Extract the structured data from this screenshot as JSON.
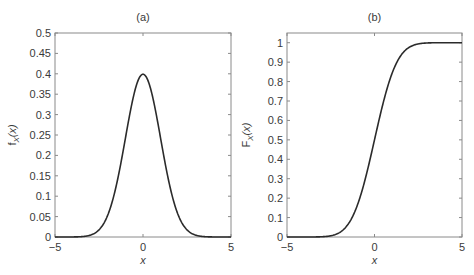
{
  "chart_data": [
    {
      "type": "line",
      "panel": "a",
      "title": "(a)",
      "xlabel": "x",
      "ylabel": "f_X(x)",
      "ylabel_main": "f",
      "ylabel_sub": "X",
      "ylabel_tail": "(x)",
      "xlim": [
        -5,
        5
      ],
      "ylim": [
        0,
        0.5
      ],
      "xticks": [
        -5,
        0,
        5
      ],
      "xtick_labels": [
        "−5",
        "0",
        "5"
      ],
      "yticks": [
        0,
        0.05,
        0.1,
        0.15,
        0.2,
        0.25,
        0.3,
        0.35,
        0.4,
        0.45,
        0.5
      ],
      "ytick_labels": [
        "0",
        "0.05",
        "0.1",
        "0.15",
        "0.2",
        "0.25",
        "0.3",
        "0.35",
        "0.4",
        "0.45",
        "0.5"
      ],
      "grid": false,
      "series": [
        {
          "name": "standard normal pdf",
          "function": "normal_pdf",
          "mean": 0,
          "std": 1,
          "x": [
            -5,
            -4,
            -3,
            -2.5,
            -2,
            -1.5,
            -1,
            -0.5,
            0,
            0.5,
            1,
            1.5,
            2,
            2.5,
            3,
            4,
            5
          ],
          "y": [
            1.5e-06,
            0.0001338,
            0.0044318,
            0.0175283,
            0.053991,
            0.1295176,
            0.2419707,
            0.3520653,
            0.3989423,
            0.3520653,
            0.2419707,
            0.1295176,
            0.053991,
            0.0175283,
            0.0044318,
            0.0001338,
            1.5e-06
          ]
        }
      ]
    },
    {
      "type": "line",
      "panel": "b",
      "title": "(b)",
      "xlabel": "x",
      "ylabel": "F_X(x)",
      "ylabel_main": "F",
      "ylabel_sub": "X",
      "ylabel_tail": "(x)",
      "xlim": [
        -5,
        5
      ],
      "ylim": [
        0,
        1.05
      ],
      "xticks": [
        -5,
        0,
        5
      ],
      "xtick_labels": [
        "−5",
        "0",
        "5"
      ],
      "yticks": [
        0,
        0.1,
        0.2,
        0.3,
        0.4,
        0.5,
        0.6,
        0.7,
        0.8,
        0.9,
        1
      ],
      "ytick_labels": [
        "0",
        "0.1",
        "0.2",
        "0.3",
        "0.4",
        "0.5",
        "0.6",
        "0.7",
        "0.8",
        "0.9",
        "1"
      ],
      "grid": false,
      "series": [
        {
          "name": "standard normal cdf",
          "function": "normal_cdf",
          "mean": 0,
          "std": 1,
          "x": [
            -5,
            -4,
            -3,
            -2.5,
            -2,
            -1.5,
            -1,
            -0.5,
            0,
            0.5,
            1,
            1.5,
            2,
            2.5,
            3,
            4,
            5
          ],
          "y": [
            3e-07,
            3.17e-05,
            0.0013499,
            0.0062097,
            0.0227501,
            0.0668072,
            0.1586553,
            0.3085375,
            0.5,
            0.6914625,
            0.8413447,
            0.9331928,
            0.9772499,
            0.9937903,
            0.9986501,
            0.9999683,
            0.9999997
          ]
        }
      ]
    }
  ]
}
